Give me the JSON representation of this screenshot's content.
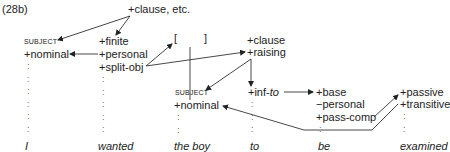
{
  "example_label": "(28b)",
  "root": "+clause, etc.",
  "col_i": {
    "role": "SUBJECT",
    "features": [
      "+nominal"
    ],
    "word": "I"
  },
  "col_wanted": {
    "features": [
      "+finite",
      "+personal",
      "+split-obj"
    ],
    "word": "wanted"
  },
  "brackets": {
    "open": "[",
    "close": "]"
  },
  "col_clause": {
    "features": [
      "+clause",
      "+raising"
    ]
  },
  "col_boy": {
    "role": "SUBJECT",
    "features": [
      "+nominal"
    ],
    "word": "the boy"
  },
  "col_to": {
    "feature_prefix": "+inf-",
    "feature_italic": "to",
    "word": "to"
  },
  "col_be": {
    "features": [
      "+base",
      "−personal",
      "+pass-comp"
    ],
    "word": "be"
  },
  "col_examined": {
    "features": [
      "+passive",
      "+transitive"
    ],
    "word": "examined"
  },
  "colon": ":"
}
